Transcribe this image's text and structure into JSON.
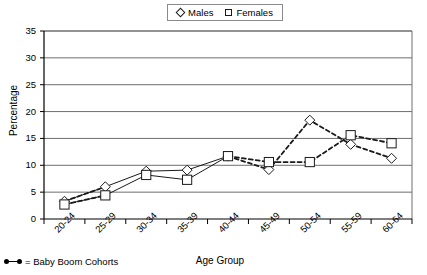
{
  "chart_data": {
    "type": "line",
    "title": "",
    "xlabel": "Age Group",
    "ylabel": "Percentage",
    "ylim": [
      0,
      35
    ],
    "yticks": [
      0,
      5,
      10,
      15,
      20,
      25,
      30,
      35
    ],
    "grid": true,
    "legend_position": "top-center",
    "categories": [
      "20-24",
      "25-29",
      "30-34",
      "35-39",
      "40-44",
      "45-49",
      "50-54",
      "55-59",
      "60-64"
    ],
    "series": [
      {
        "name": "Males",
        "marker": "diamond",
        "values": [
          3.3,
          6.0,
          8.9,
          9.1,
          11.7,
          9.2,
          18.4,
          13.9,
          11.3
        ]
      },
      {
        "name": "Females",
        "marker": "square",
        "values": [
          2.7,
          4.4,
          8.2,
          7.3,
          11.7,
          10.6,
          10.6,
          15.6,
          14.1
        ]
      }
    ],
    "annotations": {
      "baby_boom_note": "= Baby Boom Cohorts",
      "baby_boom_line_style": "dashed",
      "baby_boom_categories": [
        "20-24",
        "25-29",
        "40-44",
        "45-49",
        "50-54",
        "55-59",
        "60-64"
      ]
    }
  },
  "legend": {
    "items": [
      {
        "label": "Males",
        "marker": "diamond"
      },
      {
        "label": "Females",
        "marker": "square"
      }
    ]
  },
  "axes": {
    "y_title": "Percentage",
    "x_title": "Age Group",
    "y_tick_labels": [
      "35",
      "30",
      "25",
      "20",
      "15",
      "10",
      "5",
      "0"
    ],
    "x_tick_labels": [
      "20-24",
      "25-29",
      "30-34",
      "35-39",
      "40-44",
      "45-49",
      "50-54",
      "55-59",
      "60-64"
    ]
  },
  "footnote": {
    "text": "= Baby Boom Cohorts"
  },
  "colors": {
    "axis": "#000000",
    "grid": "#6e6e6e",
    "series_line": "#1a1a1a",
    "marker_fill": "#ffffff",
    "background": "#ffffff"
  }
}
